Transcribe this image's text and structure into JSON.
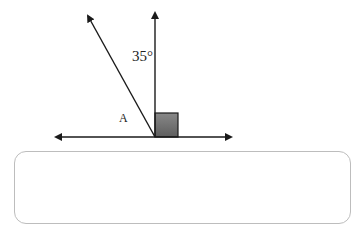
{
  "diagram": {
    "angle_label": "35°",
    "point_label": "A",
    "right_angle_marker": true,
    "colors": {
      "line": "#1a1a1a",
      "square_fill": "#6e6e6e",
      "box_border": "#bdbdbd"
    }
  },
  "answer_box": {
    "value": ""
  }
}
